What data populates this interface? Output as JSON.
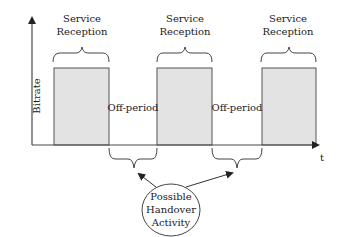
{
  "diagram": {
    "y_axis_label": "Bitrate",
    "x_axis_label": "t",
    "service_reception_label": [
      "Service",
      "Reception"
    ],
    "off_period_label": "Off-period",
    "handover_label": [
      "Possible",
      "Handover",
      "Activity"
    ],
    "bursts": [
      {
        "name": "burst-1",
        "label_line1": "Service",
        "label_line2": "Reception"
      },
      {
        "name": "burst-2",
        "label_line1": "Service",
        "label_line2": "Reception"
      },
      {
        "name": "burst-3",
        "label_line1": "Service",
        "label_line2": "Reception"
      }
    ],
    "off_periods": [
      {
        "name": "off-period-1",
        "label": "Off-period"
      },
      {
        "name": "off-period-2",
        "label": "Off-period"
      }
    ],
    "colors": {
      "bar_fill": "#e3e3e3",
      "stroke": "#444444",
      "text": "#1a1a1a"
    }
  }
}
